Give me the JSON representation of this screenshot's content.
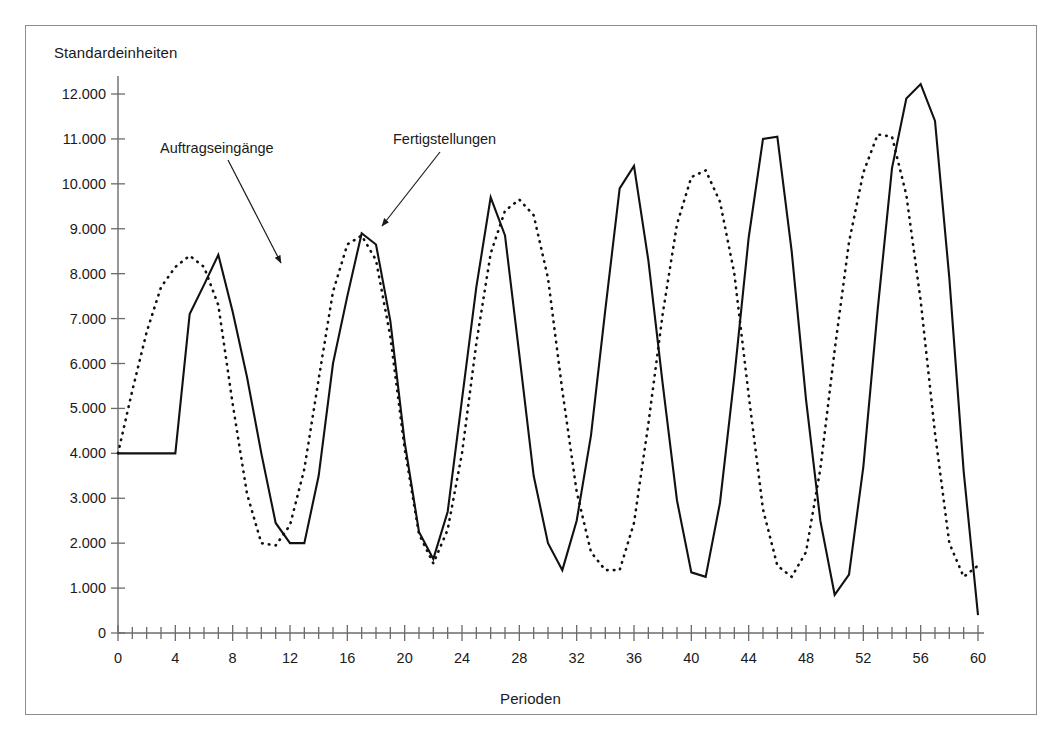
{
  "figure": {
    "y_axis_title": "Standardeinheiten",
    "x_axis_title": "Perioden",
    "frame_color": "#8c8c8c",
    "line_color": "#111111",
    "background": "#ffffff"
  },
  "annotations": [
    {
      "id": "orders",
      "label": "Auftragseingänge",
      "points_to_series": "Auftragseingänge",
      "arrow_from": [
        228,
        160
      ],
      "arrow_to": [
        281,
        263
      ]
    },
    {
      "id": "completions",
      "label": "Fertigstellungen",
      "points_to_series": "Fertigstellungen",
      "arrow_from": [
        440,
        152
      ],
      "arrow_to": [
        382,
        226
      ]
    }
  ],
  "axes": {
    "y_ticks": [
      0,
      1000,
      2000,
      3000,
      4000,
      5000,
      6000,
      7000,
      8000,
      9000,
      10000,
      11000,
      12000
    ],
    "y_tick_labels": [
      "0",
      "1.000",
      "2.000",
      "3.000",
      "4.000",
      "5.000",
      "6.000",
      "7.000",
      "8.000",
      "9.000",
      "10.000",
      "11.000",
      "12.000"
    ],
    "x_ticks_major": [
      0,
      4,
      8,
      12,
      16,
      20,
      24,
      28,
      32,
      36,
      40,
      44,
      48,
      52,
      56,
      60
    ],
    "x_tick_labels": [
      "0",
      "4",
      "8",
      "12",
      "16",
      "20",
      "24",
      "28",
      "32",
      "36",
      "40",
      "44",
      "48",
      "52",
      "56",
      "60"
    ],
    "x_minor_step": 1
  },
  "chart_data": {
    "type": "line",
    "title": "",
    "subtitle": "",
    "xlabel": "Perioden",
    "ylabel": "Standardeinheiten",
    "xlim": [
      0,
      60
    ],
    "ylim": [
      0,
      12600
    ],
    "grid": false,
    "legend": "annotations-with-arrows",
    "x": [
      0,
      1,
      2,
      3,
      4,
      5,
      6,
      7,
      8,
      9,
      10,
      11,
      12,
      13,
      14,
      15,
      16,
      17,
      18,
      19,
      20,
      21,
      22,
      23,
      24,
      25,
      26,
      27,
      28,
      29,
      30,
      31,
      32,
      33,
      34,
      35,
      36,
      37,
      38,
      39,
      40,
      41,
      42,
      43,
      44,
      45,
      46,
      47,
      48,
      49,
      50,
      51,
      52,
      53,
      54,
      55,
      56,
      57,
      58,
      59,
      60
    ],
    "series": [
      {
        "name": "Auftragseingänge",
        "style": "solid",
        "color": "#111111",
        "values": [
          4000,
          4000,
          4000,
          4000,
          4000,
          7100,
          7750,
          8420,
          7150,
          5700,
          4000,
          2450,
          2000,
          2000,
          3500,
          6000,
          7500,
          8900,
          8650,
          6950,
          4250,
          2250,
          1650,
          2700,
          5200,
          7700,
          9700,
          8850,
          6200,
          3500,
          2000,
          1400,
          2500,
          4400,
          7200,
          9900,
          10400,
          8300,
          5550,
          2950,
          1350,
          1250,
          2900,
          5700,
          8800,
          11000,
          11050,
          8500,
          5200,
          2500,
          850,
          1300,
          3700,
          7200,
          10350,
          11900,
          12220,
          11400,
          7900,
          3600,
          400
        ]
      },
      {
        "name": "Fertigstellungen",
        "style": "dotted",
        "color": "#111111",
        "values": [
          4000,
          5400,
          6700,
          7700,
          8150,
          8400,
          8150,
          7300,
          5100,
          3100,
          2000,
          1950,
          2400,
          3650,
          5650,
          7600,
          8650,
          8850,
          8300,
          6600,
          4100,
          2200,
          1550,
          2300,
          4000,
          6450,
          8450,
          9400,
          9650,
          9300,
          7900,
          5400,
          3150,
          1800,
          1400,
          1400,
          2450,
          4650,
          7100,
          9100,
          10150,
          10300,
          9600,
          8000,
          5300,
          2750,
          1500,
          1250,
          1800,
          3650,
          6300,
          8700,
          10250,
          11100,
          11050,
          9750,
          7400,
          4450,
          2000,
          1250,
          1500
        ]
      }
    ]
  }
}
